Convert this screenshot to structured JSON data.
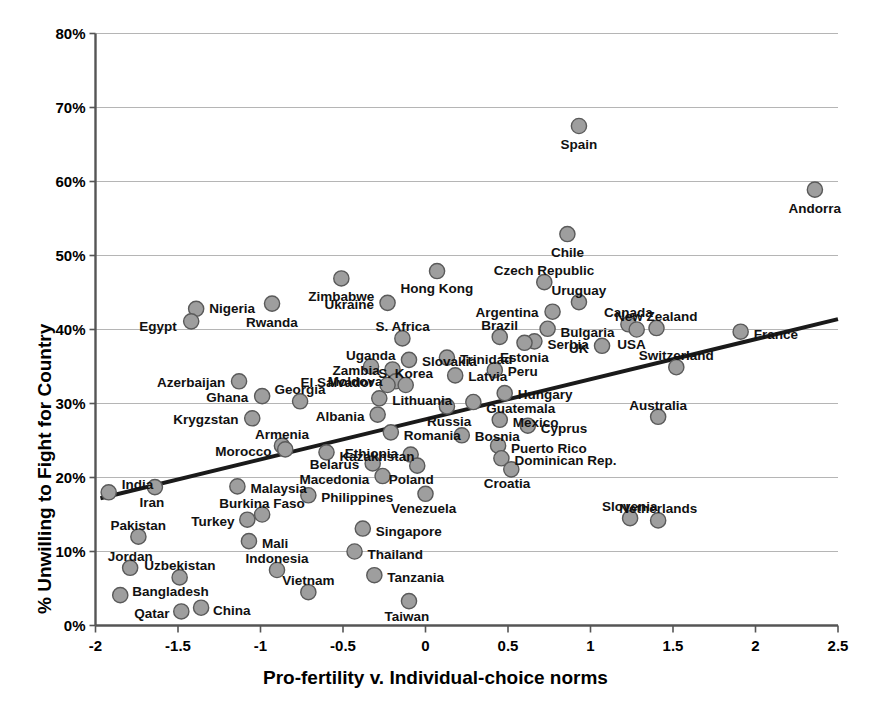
{
  "chart_data": {
    "type": "scatter",
    "title": "",
    "xlabel": "Pro-fertility v. Individual-choice norms",
    "ylabel": "% Unwilling to Fight for Country",
    "xlim": [
      -2,
      2.5
    ],
    "ylim": [
      0,
      0.8
    ],
    "grid": true,
    "legend": "none",
    "marker_fill": "#9e9e9e",
    "marker_stroke": "#5a5a5a",
    "trendline": {
      "visible": true,
      "color": "#1a1a1a",
      "x0": -1.97,
      "y0": 0.172,
      "x1": 2.5,
      "y1": 0.414
    },
    "xticks": [
      "-2",
      "-1.5",
      "-1",
      "-0.5",
      "0",
      "0.5",
      "1",
      "1.5",
      "2",
      "2.5"
    ],
    "xtick_values": [
      -2,
      -1.5,
      -1,
      -0.5,
      0,
      0.5,
      1,
      1.5,
      2,
      2.5
    ],
    "yticks": [
      "0%",
      "10%",
      "20%",
      "30%",
      "40%",
      "50%",
      "60%",
      "70%",
      "80%"
    ],
    "ytick_values": [
      0,
      0.1,
      0.2,
      0.3,
      0.4,
      0.5,
      0.6,
      0.7,
      0.8
    ],
    "points": [
      {
        "name": "Spain",
        "x": 0.93,
        "y": 0.675,
        "lx": 0,
        "ly": 18,
        "anchor": "center"
      },
      {
        "name": "Andorra",
        "x": 2.36,
        "y": 0.589,
        "lx": 0,
        "ly": 18,
        "anchor": "center"
      },
      {
        "name": "Chile",
        "x": 0.86,
        "y": 0.529,
        "lx": 0,
        "ly": 18,
        "anchor": "center"
      },
      {
        "name": "Czech Republic",
        "x": 0.72,
        "y": 0.464,
        "lx": 0,
        "ly": -12,
        "anchor": "center"
      },
      {
        "name": "Uruguay",
        "x": 0.93,
        "y": 0.437,
        "lx": 0,
        "ly": -12,
        "anchor": "center"
      },
      {
        "name": "Argentina",
        "x": 0.77,
        "y": 0.424,
        "lx": -14,
        "ly": 0,
        "anchor": "left"
      },
      {
        "name": "Hong Kong",
        "x": 0.07,
        "y": 0.479,
        "lx": 0,
        "ly": 17,
        "anchor": "center"
      },
      {
        "name": "Zimbabwe",
        "x": -0.51,
        "y": 0.469,
        "lx": 0,
        "ly": 18,
        "anchor": "center"
      },
      {
        "name": "Ukraine",
        "x": -0.23,
        "y": 0.436,
        "lx": -13,
        "ly": 1,
        "anchor": "left"
      },
      {
        "name": "Nigeria",
        "x": -1.39,
        "y": 0.428,
        "lx": 13,
        "ly": -1,
        "anchor": "right"
      },
      {
        "name": "Egypt",
        "x": -1.42,
        "y": 0.411,
        "lx": -14,
        "ly": 5,
        "anchor": "left"
      },
      {
        "name": "Rwanda",
        "x": -0.93,
        "y": 0.435,
        "lx": 0,
        "ly": 18,
        "anchor": "center"
      },
      {
        "name": "Canada",
        "x": 1.23,
        "y": 0.407,
        "lx": 0,
        "ly": -12,
        "anchor": "center"
      },
      {
        "name": "New Zealand",
        "x": 1.4,
        "y": 0.402,
        "lx": 0,
        "ly": -12,
        "anchor": "center"
      },
      {
        "name": "France",
        "x": 1.91,
        "y": 0.397,
        "lx": 13,
        "ly": 2,
        "anchor": "right"
      },
      {
        "name": "Bulgaria",
        "x": 0.74,
        "y": 0.401,
        "lx": 13,
        "ly": 3,
        "anchor": "right"
      },
      {
        "name": "USA",
        "x": 1.28,
        "y": 0.4,
        "lx": -5,
        "ly": 14,
        "anchor": "center"
      },
      {
        "name": "Brazil",
        "x": 0.45,
        "y": 0.39,
        "lx": 0,
        "ly": -12,
        "anchor": "center"
      },
      {
        "name": "S. Africa",
        "x": -0.14,
        "y": 0.388,
        "lx": 0,
        "ly": -12,
        "anchor": "center"
      },
      {
        "name": "Serbia",
        "x": 0.66,
        "y": 0.384,
        "lx": 13,
        "ly": 3,
        "anchor": "right"
      },
      {
        "name": "Estonia",
        "x": 0.6,
        "y": 0.382,
        "lx": 0,
        "ly": 14,
        "anchor": "center"
      },
      {
        "name": "UK",
        "x": 1.07,
        "y": 0.378,
        "lx": -13,
        "ly": 2,
        "anchor": "left"
      },
      {
        "name": "Switzerland",
        "x": 1.52,
        "y": 0.349,
        "lx": 0,
        "ly": -12,
        "anchor": "center"
      },
      {
        "name": "Slovakia",
        "x": -0.1,
        "y": 0.359,
        "lx": 13,
        "ly": 1,
        "anchor": "right"
      },
      {
        "name": "Trinidad",
        "x": 0.13,
        "y": 0.362,
        "lx": 13,
        "ly": 1,
        "anchor": "right"
      },
      {
        "name": "Uganda",
        "x": -0.33,
        "y": 0.35,
        "lx": 0,
        "ly": -12,
        "anchor": "center"
      },
      {
        "name": "Zambia",
        "x": -0.2,
        "y": 0.346,
        "lx": -13,
        "ly": 1,
        "anchor": "left"
      },
      {
        "name": "Peru",
        "x": 0.42,
        "y": 0.345,
        "lx": 13,
        "ly": 1,
        "anchor": "right"
      },
      {
        "name": "Latvia",
        "x": 0.18,
        "y": 0.338,
        "lx": 13,
        "ly": 1,
        "anchor": "right"
      },
      {
        "name": "Moldova",
        "x": -0.18,
        "y": 0.33,
        "lx": -13,
        "ly": 0,
        "anchor": "left"
      },
      {
        "name": "El Salvador",
        "x": -0.23,
        "y": 0.325,
        "lx": -13,
        "ly": -3,
        "anchor": "left"
      },
      {
        "name": "S. Korea",
        "x": -0.12,
        "y": 0.325,
        "lx": 0,
        "ly": -12,
        "anchor": "center"
      },
      {
        "name": "Azerbaijan",
        "x": -1.13,
        "y": 0.33,
        "lx": -14,
        "ly": 1,
        "anchor": "left"
      },
      {
        "name": "Hungary",
        "x": 0.48,
        "y": 0.314,
        "lx": 13,
        "ly": 1,
        "anchor": "right"
      },
      {
        "name": "Lithuania",
        "x": -0.28,
        "y": 0.307,
        "lx": 13,
        "ly": 2,
        "anchor": "right"
      },
      {
        "name": "Georgia",
        "x": -0.76,
        "y": 0.303,
        "lx": 0,
        "ly": -12,
        "anchor": "center"
      },
      {
        "name": "Ghana",
        "x": -0.99,
        "y": 0.31,
        "lx": -14,
        "ly": 1,
        "anchor": "left"
      },
      {
        "name": "Guatemala",
        "x": 0.29,
        "y": 0.302,
        "lx": 13,
        "ly": 6,
        "anchor": "right"
      },
      {
        "name": "Russia",
        "x": 0.13,
        "y": 0.296,
        "lx": 2,
        "ly": 15,
        "anchor": "center"
      },
      {
        "name": "Albania",
        "x": -0.29,
        "y": 0.285,
        "lx": -13,
        "ly": 1,
        "anchor": "left"
      },
      {
        "name": "Krygzstan",
        "x": -1.05,
        "y": 0.28,
        "lx": -14,
        "ly": 1,
        "anchor": "left"
      },
      {
        "name": "Australia",
        "x": 1.41,
        "y": 0.282,
        "lx": 0,
        "ly": -12,
        "anchor": "center"
      },
      {
        "name": "Mexico",
        "x": 0.45,
        "y": 0.278,
        "lx": 13,
        "ly": 2,
        "anchor": "right"
      },
      {
        "name": "Cyprus",
        "x": 0.62,
        "y": 0.27,
        "lx": 13,
        "ly": 2,
        "anchor": "right"
      },
      {
        "name": "Romania",
        "x": -0.21,
        "y": 0.261,
        "lx": 13,
        "ly": 3,
        "anchor": "right"
      },
      {
        "name": "Bosnia",
        "x": 0.22,
        "y": 0.257,
        "lx": 13,
        "ly": 1,
        "anchor": "right"
      },
      {
        "name": "Armenia",
        "x": -0.87,
        "y": 0.243,
        "lx": 0,
        "ly": -12,
        "anchor": "center"
      },
      {
        "name": "Morocco",
        "x": -0.85,
        "y": 0.238,
        "lx": -14,
        "ly": 2,
        "anchor": "left"
      },
      {
        "name": "Puerto Rico",
        "x": 0.44,
        "y": 0.243,
        "lx": 13,
        "ly": 2,
        "anchor": "right"
      },
      {
        "name": "Dominican Rep.",
        "x": 0.46,
        "y": 0.226,
        "lx": 13,
        "ly": 2,
        "anchor": "right"
      },
      {
        "name": "Ethiopia",
        "x": -0.09,
        "y": 0.231,
        "lx": -13,
        "ly": -2,
        "anchor": "left"
      },
      {
        "name": "Kazakhstan",
        "x": -0.6,
        "y": 0.234,
        "lx": 13,
        "ly": 4,
        "anchor": "right"
      },
      {
        "name": "Belarus",
        "x": -0.32,
        "y": 0.219,
        "lx": -13,
        "ly": 1,
        "anchor": "left"
      },
      {
        "name": "Poland",
        "x": -0.05,
        "y": 0.216,
        "lx": -6,
        "ly": 13,
        "anchor": "center"
      },
      {
        "name": "Croatia",
        "x": 0.52,
        "y": 0.211,
        "lx": -4,
        "ly": 14,
        "anchor": "center"
      },
      {
        "name": "Macedonia",
        "x": -0.26,
        "y": 0.202,
        "lx": -13,
        "ly": 3,
        "anchor": "left"
      },
      {
        "name": "India",
        "x": -1.92,
        "y": 0.18,
        "lx": 13,
        "ly": -8,
        "anchor": "right"
      },
      {
        "name": "Iran",
        "x": -1.64,
        "y": 0.187,
        "lx": -3,
        "ly": 15,
        "anchor": "center"
      },
      {
        "name": "Malaysia",
        "x": -1.14,
        "y": 0.188,
        "lx": 13,
        "ly": 2,
        "anchor": "right"
      },
      {
        "name": "Venezuela",
        "x": 0.0,
        "y": 0.178,
        "lx": -2,
        "ly": 14,
        "anchor": "center"
      },
      {
        "name": "Philippines",
        "x": -0.71,
        "y": 0.176,
        "lx": 13,
        "ly": 2,
        "anchor": "right"
      },
      {
        "name": "Burkina Faso",
        "x": -0.99,
        "y": 0.15,
        "lx": 0,
        "ly": -12,
        "anchor": "center"
      },
      {
        "name": "Turkey",
        "x": -1.08,
        "y": 0.143,
        "lx": -13,
        "ly": 1,
        "anchor": "left"
      },
      {
        "name": "Slovenia",
        "x": 1.24,
        "y": 0.145,
        "lx": 0,
        "ly": -12,
        "anchor": "center"
      },
      {
        "name": "Netherlands",
        "x": 1.41,
        "y": 0.142,
        "lx": 0,
        "ly": -12,
        "anchor": "center"
      },
      {
        "name": "Singapore",
        "x": -0.38,
        "y": 0.131,
        "lx": 13,
        "ly": 2,
        "anchor": "right"
      },
      {
        "name": "Mali",
        "x": -1.07,
        "y": 0.114,
        "lx": 13,
        "ly": 2,
        "anchor": "right"
      },
      {
        "name": "Pakistan",
        "x": -1.74,
        "y": 0.12,
        "lx": 0,
        "ly": -12,
        "anchor": "center"
      },
      {
        "name": "Thailand",
        "x": -0.43,
        "y": 0.1,
        "lx": 13,
        "ly": 2,
        "anchor": "right"
      },
      {
        "name": "Indonesia",
        "x": -0.9,
        "y": 0.075,
        "lx": 0,
        "ly": -12,
        "anchor": "center"
      },
      {
        "name": "Jordan",
        "x": -1.79,
        "y": 0.078,
        "lx": 0,
        "ly": -12,
        "anchor": "center"
      },
      {
        "name": "Uzbekistan",
        "x": -1.49,
        "y": 0.065,
        "lx": 0,
        "ly": -12,
        "anchor": "center"
      },
      {
        "name": "Tanzania",
        "x": -0.31,
        "y": 0.068,
        "lx": 13,
        "ly": 2,
        "anchor": "right"
      },
      {
        "name": "Vietnam",
        "x": -0.71,
        "y": 0.045,
        "lx": 0,
        "ly": -12,
        "anchor": "center"
      },
      {
        "name": "Bangladesh",
        "x": -1.85,
        "y": 0.041,
        "lx": 12,
        "ly": -4,
        "anchor": "right"
      },
      {
        "name": "Qatar",
        "x": -1.48,
        "y": 0.019,
        "lx": -12,
        "ly": 2,
        "anchor": "left"
      },
      {
        "name": "China",
        "x": -1.36,
        "y": 0.024,
        "lx": 12,
        "ly": 2,
        "anchor": "right"
      },
      {
        "name": "Taiwan",
        "x": -0.1,
        "y": 0.033,
        "lx": -2,
        "ly": 15,
        "anchor": "center"
      }
    ]
  }
}
